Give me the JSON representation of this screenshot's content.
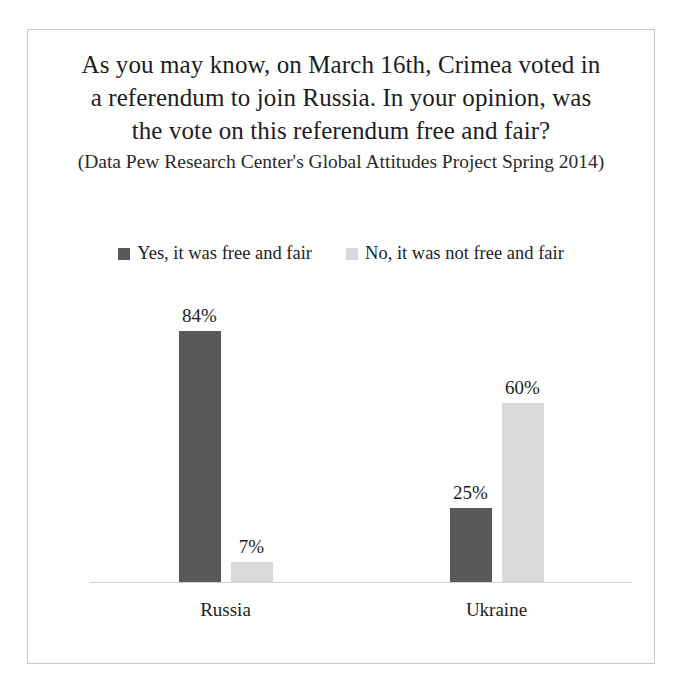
{
  "figure": {
    "border_color": "#c8c8c8",
    "background": "#ffffff"
  },
  "title": {
    "main": "As you may know, on March 16th, Crimea voted in a referendum to join Russia. In your opinion, was the vote on this referendum free and fair?",
    "subtitle": "(Data  Pew Research Center's Global Attitudes Project Spring 2014)"
  },
  "legend": {
    "items": [
      {
        "label": "Yes, it was free and fair",
        "color": "#595959"
      },
      {
        "label": "No, it was not free and fair",
        "color": "#d9d9d9"
      }
    ]
  },
  "chart_data": {
    "type": "bar",
    "title": "As you may know, on March 16th, Crimea voted in a referendum to join Russia. In your opinion, was the vote on this referendum free and fair?",
    "subtitle": "(Data  Pew Research Center's Global Attitudes Project Spring 2014)",
    "categories": [
      "Russia",
      "Ukraine"
    ],
    "series": [
      {
        "name": "Yes, it was free and fair",
        "color": "#595959",
        "values": [
          84,
          7
        ]
      },
      {
        "name": "No, it was not free and fair",
        "color": "#d9d9d9",
        "values": [
          25,
          60
        ]
      }
    ],
    "display_groups": [
      {
        "category": "Russia",
        "bars": [
          {
            "series": "Yes, it was free and fair",
            "value": 84,
            "label": "84%",
            "color": "#595959"
          },
          {
            "series": "No, it was not free and fair",
            "value": 7,
            "label": "7%",
            "color": "#d9d9d9"
          }
        ]
      },
      {
        "category": "Ukraine",
        "bars": [
          {
            "series": "Yes, it was free and fair",
            "value": 25,
            "label": "25%",
            "color": "#595959"
          },
          {
            "series": "No, it was not free and fair",
            "value": 60,
            "label": "60%",
            "color": "#d9d9d9"
          }
        ]
      }
    ],
    "value_labels": [
      "84%",
      "7%",
      "25%",
      "60%"
    ],
    "xlabel": "",
    "ylabel": "",
    "ylim": [
      0,
      100
    ],
    "unit": "%",
    "grid": false,
    "axis_visible": true,
    "y_ticks_visible": false,
    "legend_position": "top"
  }
}
